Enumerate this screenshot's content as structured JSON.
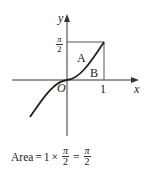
{
  "diagram": {
    "axes": {
      "x_label": "x",
      "y_label": "y",
      "origin_label": "O"
    },
    "x_tick": "1",
    "y_tick": {
      "numerator": "π",
      "denominator": "2"
    },
    "regions": [
      {
        "label": "A"
      },
      {
        "label": "B"
      }
    ],
    "colors": {
      "ink": "#222222",
      "box": "#555555"
    }
  },
  "caption": {
    "prefix": "Area",
    "eq1": "=",
    "factor": "1",
    "times": "×",
    "frac1": {
      "numerator": "π",
      "denominator": "2"
    },
    "eq2": "=",
    "frac2": {
      "numerator": "π",
      "denominator": "2"
    }
  }
}
